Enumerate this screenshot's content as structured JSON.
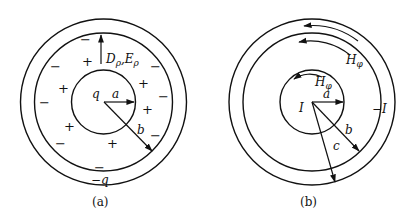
{
  "figure_a": {
    "caption": "(a)",
    "center_charge": "q",
    "outer_charge": "−q",
    "field_label_D": "D",
    "field_label_E": "E",
    "subscript": "ρ",
    "comma": ",",
    "radius_a": "a",
    "radius_b": "b",
    "plus_signs": [
      "+",
      "+",
      "+",
      "+",
      "+",
      "+"
    ],
    "minus_signs": [
      "−",
      "−",
      "−",
      "−",
      "−",
      "−",
      "−",
      "−"
    ]
  },
  "figure_b": {
    "caption": "(b)",
    "inner_current": "I",
    "outer_current": "−I",
    "field_label_H": "H",
    "subscript": "φ",
    "radius_a": "a",
    "radius_b": "b",
    "radius_c": "c"
  }
}
